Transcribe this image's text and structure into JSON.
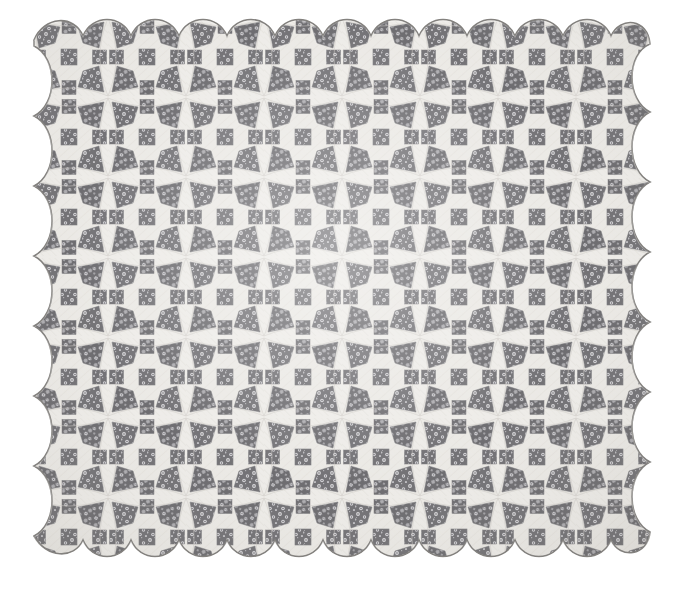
{
  "image": {
    "kind": "photograph",
    "subject": "antique patchwork quilt",
    "title": "Star / pinwheel patchwork quilt with scalloped edge",
    "background_color": "#ffffff",
    "width": 686,
    "height": 595
  },
  "quilt": {
    "pattern_name": "eight-pointed star patchwork",
    "block_columns": 8,
    "block_rows": 7,
    "block_size_px": 78,
    "edge_style": "scalloped",
    "scallops_top": 8,
    "scallops_bottom": 8,
    "scallops_left": 7,
    "scallops_right": 7,
    "bounds": {
      "left": 30,
      "top": 18,
      "right": 652,
      "bottom": 578
    },
    "colors": {
      "background_cloth": "#eceae6",
      "background_cloth_shade": "#e2dfda",
      "print_fabric_dark": "#5c5b5f",
      "print_fabric_mid": "#7e7d81",
      "print_fabric_light": "#c9c8cb",
      "seam_line": "#b8b6b2",
      "edge_line": "#8d8b88",
      "page_background": "#ffffff"
    },
    "elements": {
      "star_points": "dark floral print kite shapes radiating from block corners",
      "center_square": "dark floral print square at block center",
      "corner_squares": "dark floral print squares at block midpoints",
      "ground": "cream muslin concave curved patches"
    }
  }
}
